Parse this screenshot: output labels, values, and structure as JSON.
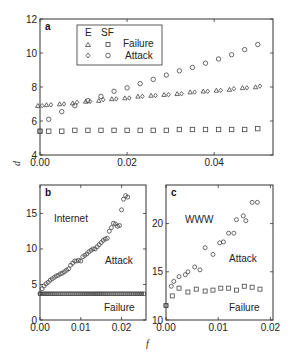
{
  "chart_data": [
    {
      "panel": "a",
      "type": "scatter",
      "title": "",
      "xlabel": "",
      "ylabel": "d",
      "xlim": [
        0,
        0.0535
      ],
      "ylim": [
        4,
        12
      ],
      "xticks": [
        "0.00",
        "0.02",
        "0.04"
      ],
      "xtick_values": [
        0,
        0.02,
        0.04
      ],
      "yticks": [
        "4",
        "6",
        "8",
        "10",
        "12"
      ],
      "ytick_values": [
        4,
        6,
        8,
        10,
        12
      ],
      "legend": {
        "header": [
          "E",
          "SF"
        ],
        "rows": [
          "Failure",
          "Attack"
        ],
        "position": "upper-left"
      },
      "series": [
        {
          "name": "E Failure",
          "marker": "triangle",
          "x": [
            0.0,
            0.002,
            0.005,
            0.008,
            0.011,
            0.014,
            0.017,
            0.02,
            0.023,
            0.026,
            0.029,
            0.032,
            0.035,
            0.038,
            0.041,
            0.044,
            0.047,
            0.05
          ],
          "y": [
            6.9,
            6.95,
            7.0,
            7.05,
            7.15,
            7.2,
            7.3,
            7.35,
            7.45,
            7.5,
            7.55,
            7.6,
            7.7,
            7.75,
            7.8,
            7.85,
            7.95,
            8.0
          ]
        },
        {
          "name": "E Attack",
          "marker": "diamond",
          "x": [
            0.0,
            0.002,
            0.005,
            0.008,
            0.011,
            0.014,
            0.017,
            0.02,
            0.023,
            0.026,
            0.029,
            0.032,
            0.035,
            0.038,
            0.041,
            0.044,
            0.047,
            0.05
          ],
          "y": [
            6.9,
            6.95,
            7.0,
            7.1,
            7.15,
            7.25,
            7.3,
            7.35,
            7.45,
            7.5,
            7.55,
            7.6,
            7.7,
            7.75,
            7.8,
            7.9,
            7.95,
            8.05
          ]
        },
        {
          "name": "SF Failure",
          "marker": "square",
          "x": [
            0.0,
            0.002,
            0.005,
            0.008,
            0.011,
            0.014,
            0.017,
            0.02,
            0.023,
            0.026,
            0.029,
            0.032,
            0.035,
            0.038,
            0.041,
            0.044,
            0.047,
            0.05
          ],
          "y": [
            5.4,
            5.4,
            5.4,
            5.45,
            5.45,
            5.45,
            5.45,
            5.45,
            5.45,
            5.45,
            5.45,
            5.5,
            5.5,
            5.5,
            5.5,
            5.5,
            5.5,
            5.55
          ]
        },
        {
          "name": "SF Attack",
          "marker": "circle",
          "x": [
            0.0,
            0.002,
            0.005,
            0.008,
            0.011,
            0.014,
            0.017,
            0.02,
            0.023,
            0.026,
            0.029,
            0.032,
            0.035,
            0.038,
            0.041,
            0.044,
            0.047,
            0.05
          ],
          "y": [
            5.4,
            6.1,
            6.55,
            6.9,
            7.2,
            7.45,
            7.75,
            7.95,
            8.2,
            8.45,
            8.7,
            8.95,
            9.15,
            9.4,
            9.65,
            9.9,
            10.2,
            10.5
          ]
        }
      ]
    },
    {
      "panel": "b",
      "type": "scatter",
      "title": "",
      "xlabel": "f",
      "ylabel": "",
      "xlim": [
        0,
        0.026
      ],
      "ylim": [
        0,
        19
      ],
      "xticks": [
        "0.00",
        "0.01",
        "0.02"
      ],
      "xtick_values": [
        0,
        0.01,
        0.02
      ],
      "yticks": [
        "0",
        "5",
        "10",
        "15"
      ],
      "ytick_values": [
        0,
        5,
        10,
        15
      ],
      "annotations": [
        {
          "text": "Internet",
          "x": 0.0035,
          "y": 14.5
        },
        {
          "text": "Attack",
          "x": 0.014,
          "y": 8.2
        },
        {
          "text": "Failure",
          "x": 0.0155,
          "y": 1.4
        }
      ],
      "series": [
        {
          "name": "Attack",
          "marker": "circle",
          "x": [
            0.0,
            0.0005,
            0.001,
            0.0015,
            0.002,
            0.0025,
            0.003,
            0.0035,
            0.004,
            0.0045,
            0.005,
            0.0055,
            0.006,
            0.0065,
            0.007,
            0.0075,
            0.008,
            0.0085,
            0.009,
            0.0095,
            0.01,
            0.0105,
            0.011,
            0.0115,
            0.012,
            0.0125,
            0.013,
            0.0135,
            0.014,
            0.0145,
            0.015,
            0.0155,
            0.016,
            0.0165,
            0.017,
            0.0175,
            0.018,
            0.0185,
            0.019,
            0.0195,
            0.02,
            0.0205,
            0.021,
            0.0215,
            0.022,
            0.0225,
            0.023,
            0.0235,
            0.024,
            0.0245
          ],
          "y": [
            3.7,
            4.4,
            4.8,
            5.1,
            5.3,
            5.6,
            5.8,
            6.0,
            6.2,
            6.3,
            6.5,
            6.6,
            6.8,
            7.0,
            7.2,
            7.7,
            8.0,
            8.3,
            8.3,
            8.4,
            8.3,
            8.9,
            9.1,
            9.3,
            9.6,
            9.8,
            10.0,
            10.0,
            10.3,
            10.6,
            10.9,
            11.2,
            11.4,
            11.5,
            12.5,
            13.0,
            13.6,
            13.5,
            13.2,
            13.3,
            15.5,
            17.0,
            17.5,
            17.3
          ],
          "note": "approximate reading"
        },
        {
          "name": "Failure",
          "marker": "square",
          "x_range": [
            0.0,
            0.0255
          ],
          "count": 52,
          "y_constant": 3.7
        }
      ]
    },
    {
      "panel": "c",
      "type": "scatter",
      "title": "",
      "xlabel": "",
      "ylabel": "",
      "xlim": [
        0,
        0.0205
      ],
      "ylim": [
        10,
        24
      ],
      "xticks": [
        "0.00",
        "0.01",
        "0.02"
      ],
      "xtick_values": [
        0,
        0.01,
        0.02
      ],
      "yticks": [
        "10",
        "15",
        "20"
      ],
      "ytick_values": [
        10,
        15,
        20
      ],
      "annotations": [
        {
          "text": "WWW",
          "x": 0.003,
          "y": 20.8
        },
        {
          "text": "Attack",
          "x": 0.0095,
          "y": 16.0
        },
        {
          "text": "Failure",
          "x": 0.0095,
          "y": 11.0
        }
      ],
      "series": [
        {
          "name": "Attack",
          "marker": "circle",
          "x": [
            0.0,
            0.001,
            0.0015,
            0.0025,
            0.0037,
            0.0042,
            0.0055,
            0.0065,
            0.0075,
            0.009,
            0.0103,
            0.011,
            0.012,
            0.013,
            0.0135,
            0.0148,
            0.0153,
            0.0165,
            0.0175
          ],
          "y": [
            11.5,
            13.5,
            14.0,
            14.5,
            14.7,
            15.0,
            15.5,
            15.2,
            17.5,
            16.8,
            18.0,
            18.1,
            19.0,
            19.0,
            20.4,
            20.8,
            20.3,
            22.2,
            22.2
          ]
        },
        {
          "name": "Failure",
          "marker": "square",
          "x": [
            0.0,
            0.0012,
            0.0025,
            0.0042,
            0.0058,
            0.0075,
            0.009,
            0.0105,
            0.012,
            0.0135,
            0.015,
            0.0165,
            0.018
          ],
          "y": [
            11.5,
            12.5,
            13.3,
            12.9,
            13.2,
            13.0,
            13.1,
            13.3,
            13.3,
            13.1,
            13.5,
            13.4,
            13.2
          ]
        }
      ]
    }
  ],
  "labels": {
    "panel_a": "a",
    "panel_b": "b",
    "panel_c": "c",
    "ylabel": "d",
    "xlabel": "f",
    "legend_E": "E",
    "legend_SF": "SF",
    "legend_failure": "Failure",
    "legend_attack": "Attack",
    "b_internet": "Internet",
    "b_attack": "Attack",
    "b_failure": "Failure",
    "c_www": "WWW",
    "c_attack": "Attack",
    "c_failure": "Failure"
  }
}
